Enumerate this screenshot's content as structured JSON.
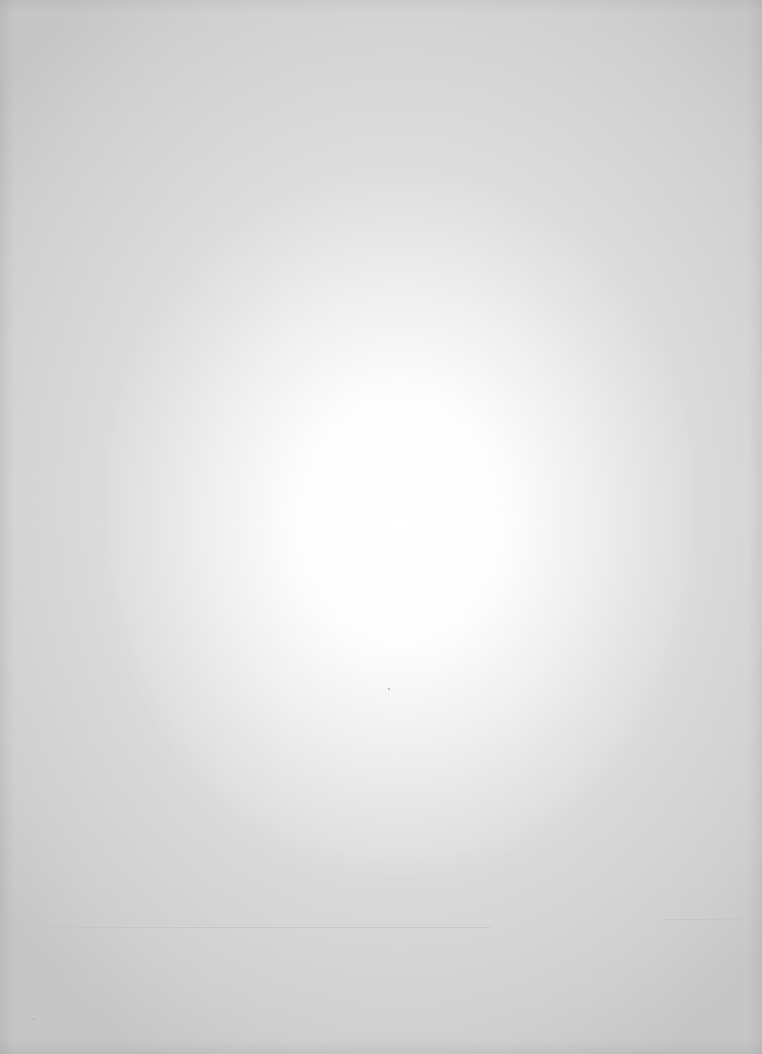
{
  "document": {
    "type": "blank scanned page",
    "text": "",
    "background_center_color": "#ffffff",
    "background_edge_color": "#dcdcdc",
    "crease_color": "#c4c4c4"
  }
}
